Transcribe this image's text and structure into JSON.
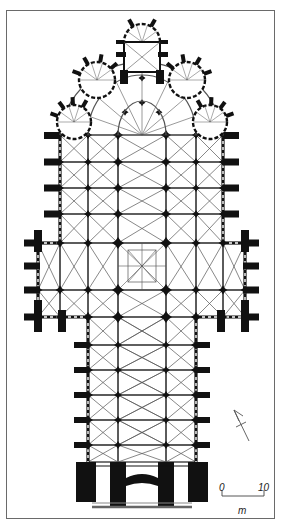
{
  "figure": {
    "colors": {
      "ink": "#111111",
      "vault_line": "#555555",
      "frame": "#6a6a6a",
      "background": "#ffffff"
    }
  },
  "scale_bar": {
    "start_label": "0",
    "end_label": "10",
    "unit_label": "m"
  },
  "north_arrow": {
    "icon": "north-arrow-icon"
  },
  "plan": {
    "choir_rows": 4,
    "transept_rows": 3,
    "nave_bays": 6,
    "apse_radiating_chapels": 5,
    "aisles_each_side": 2
  }
}
